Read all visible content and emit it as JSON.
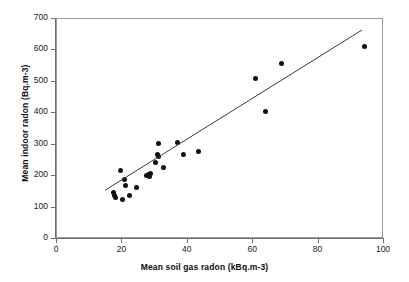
{
  "chart_data": {
    "type": "scatter",
    "title": "",
    "xlabel": "Mean soil gas radon (kBq.m-3)",
    "ylabel": "Mean indoor radon (Bq.m-3)",
    "xlim": [
      0,
      100
    ],
    "ylim": [
      0,
      700
    ],
    "xticks": [
      0,
      20,
      40,
      60,
      80,
      100
    ],
    "yticks": [
      0,
      100,
      200,
      300,
      400,
      500,
      600,
      700
    ],
    "xtick_labels": [
      "0",
      "20",
      "40",
      "60",
      "80",
      "100"
    ],
    "ytick_labels": [
      "0",
      "100",
      "200",
      "300",
      "400",
      "500",
      "600",
      "700"
    ],
    "grid": false,
    "legend": null,
    "marker": "filled-circle",
    "marker_color": "#111111",
    "points": [
      {
        "x": 17.4,
        "y": 148
      },
      {
        "x": 17.6,
        "y": 140
      },
      {
        "x": 18.0,
        "y": 133
      },
      {
        "x": 19.4,
        "y": 219
      },
      {
        "x": 19.9,
        "y": 125
      },
      {
        "x": 20.6,
        "y": 190
      },
      {
        "x": 20.8,
        "y": 170
      },
      {
        "x": 22.3,
        "y": 139
      },
      {
        "x": 24.4,
        "y": 163
      },
      {
        "x": 27.5,
        "y": 203
      },
      {
        "x": 28.0,
        "y": 205
      },
      {
        "x": 28.4,
        "y": 200
      },
      {
        "x": 28.6,
        "y": 207
      },
      {
        "x": 30.1,
        "y": 245
      },
      {
        "x": 30.6,
        "y": 268
      },
      {
        "x": 30.9,
        "y": 262
      },
      {
        "x": 31.0,
        "y": 305
      },
      {
        "x": 32.6,
        "y": 227
      },
      {
        "x": 36.9,
        "y": 308
      },
      {
        "x": 38.7,
        "y": 268
      },
      {
        "x": 43.4,
        "y": 277
      },
      {
        "x": 60.6,
        "y": 511
      },
      {
        "x": 63.9,
        "y": 406
      },
      {
        "x": 68.6,
        "y": 559
      },
      {
        "x": 93.9,
        "y": 613
      }
    ],
    "trendline": {
      "type": "linear-fit",
      "x_start": 15.0,
      "y_start": 152,
      "x_end": 93.6,
      "y_end": 662,
      "color": "#3a3a3a"
    }
  },
  "axes": {
    "x_title": "Mean soil gas radon (kBq.m-3)",
    "y_title": "Mean indoor radon (Bq.m-3)"
  }
}
